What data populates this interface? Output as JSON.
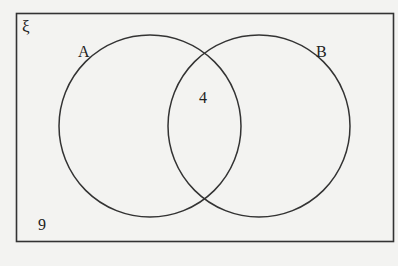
{
  "diagram": {
    "type": "venn",
    "universal_set": {
      "symbol": "ξ",
      "outside_value": "9"
    },
    "sets": [
      {
        "label": "A"
      },
      {
        "label": "B"
      }
    ],
    "regions": {
      "A_only": "",
      "B_only": "",
      "A_and_B": "4",
      "neither": "9"
    },
    "colors": {
      "background": "#f3f3f1",
      "line": "#333333",
      "text": "#222222"
    }
  }
}
